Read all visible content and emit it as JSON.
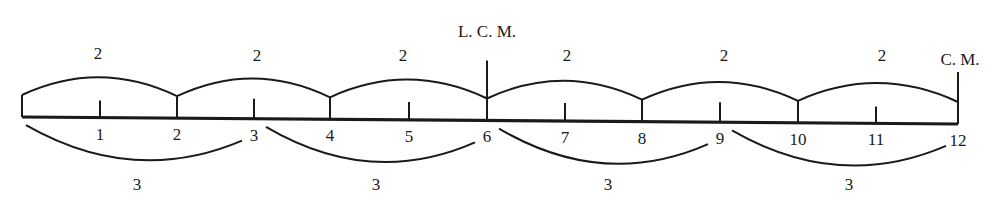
{
  "diagram": {
    "baseline": {
      "start": {
        "x": 22,
        "y": 117
      },
      "end": {
        "x": 958,
        "y": 124
      }
    },
    "ticks": [
      {
        "beat": 0,
        "label": "",
        "x": 22,
        "height": 22
      },
      {
        "beat": 1,
        "label": "1",
        "x": 100,
        "height": 17
      },
      {
        "beat": 2,
        "label": "2",
        "x": 177,
        "height": 22
      },
      {
        "beat": 3,
        "label": "3",
        "x": 254,
        "height": 20
      },
      {
        "beat": 4,
        "label": "4",
        "x": 330,
        "height": 22
      },
      {
        "beat": 5,
        "label": "5",
        "x": 409,
        "height": 18
      },
      {
        "beat": 6,
        "label": "6",
        "x": 487,
        "height": 60
      },
      {
        "beat": 7,
        "label": "7",
        "x": 565,
        "height": 18
      },
      {
        "beat": 8,
        "label": "8",
        "x": 642,
        "height": 22
      },
      {
        "beat": 9,
        "label": "9",
        "x": 720,
        "height": 20
      },
      {
        "beat": 10,
        "label": "10",
        "x": 798,
        "height": 22
      },
      {
        "beat": 11,
        "label": "11",
        "x": 876,
        "height": 17
      },
      {
        "beat": 12,
        "label": "12",
        "x": 958,
        "height": 52
      }
    ],
    "upper_groups": [
      {
        "label": "2",
        "from": 0,
        "to": 2,
        "label_x": 98
      },
      {
        "label": "2",
        "from": 2,
        "to": 4,
        "label_x": 257
      },
      {
        "label": "2",
        "from": 4,
        "to": 6,
        "label_x": 403
      },
      {
        "label": "2",
        "from": 6,
        "to": 8,
        "label_x": 567
      },
      {
        "label": "2",
        "from": 8,
        "to": 10,
        "label_x": 724
      },
      {
        "label": "2",
        "from": 10,
        "to": 12,
        "label_x": 882
      }
    ],
    "lower_groups": [
      {
        "label": "3",
        "from": 0,
        "to": 3,
        "label_x": 137
      },
      {
        "label": "3",
        "from": 3,
        "to": 6,
        "label_x": 376
      },
      {
        "label": "3",
        "from": 6,
        "to": 9,
        "label_x": 608
      },
      {
        "label": "3",
        "from": 9,
        "to": 12,
        "label_x": 849
      }
    ],
    "markers": {
      "lcm": {
        "label": "L. C. M.",
        "x": 487,
        "y": 37
      },
      "cm": {
        "label": "C. M.",
        "x": 958,
        "y": 65
      }
    }
  }
}
